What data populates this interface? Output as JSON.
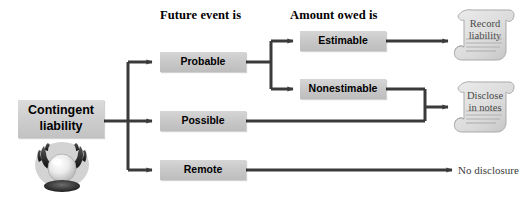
{
  "diagram": {
    "headers": [
      {
        "id": "future-event",
        "label": "Future event is",
        "x": 160,
        "y": 8
      },
      {
        "id": "amount-owed",
        "label": "Amount owed is",
        "x": 290,
        "y": 8
      }
    ],
    "root": {
      "id": "contingent-liability",
      "label": "Contingent\nliability",
      "x": 18,
      "y": 100,
      "w": 86,
      "h": 38
    },
    "likelihood_nodes": [
      {
        "id": "probable",
        "label": "Probable",
        "x": 160,
        "y": 52,
        "w": 86,
        "h": 20
      },
      {
        "id": "possible",
        "label": "Possible",
        "x": 160,
        "y": 111,
        "w": 86,
        "h": 20
      },
      {
        "id": "remote",
        "label": "Remote",
        "x": 160,
        "y": 160,
        "w": 86,
        "h": 20
      }
    ],
    "amount_nodes": [
      {
        "id": "estimable",
        "label": "Estimable",
        "x": 300,
        "y": 31,
        "w": 86,
        "h": 20
      },
      {
        "id": "nonestimable",
        "label": "Nonestimable",
        "x": 300,
        "y": 79,
        "w": 86,
        "h": 20
      }
    ],
    "outcomes": [
      {
        "id": "record-liability",
        "label": "Record\nliability",
        "kind": "scroll",
        "x": 452,
        "y": 6,
        "w": 66,
        "h": 58
      },
      {
        "id": "disclose-in-notes",
        "label": "Disclose\nin notes",
        "kind": "scroll",
        "x": 452,
        "y": 78,
        "w": 66,
        "h": 58
      },
      {
        "id": "no-disclosure",
        "label": "No disclosure",
        "kind": "text",
        "x": 458,
        "y": 164
      }
    ],
    "icons": {
      "crystal_ball": {
        "id": "crystal-ball-icon",
        "x": 33,
        "y": 140,
        "w": 58,
        "h": 54
      }
    },
    "colors": {
      "node_fill": "#c9c9c9",
      "node_text": "#000000",
      "wire": "#3a3a3a",
      "scroll_fill": "#dcdcdc",
      "scroll_text": "#4a4a4a",
      "background": "#ffffff"
    },
    "wires": {
      "trunk_x": 128,
      "trunk_top_y": 62,
      "trunk_bottom_y": 170,
      "branch_x": 271,
      "merge_x": 425,
      "rows": {
        "probable_y": 62,
        "possible_y": 121,
        "remote_y": 170,
        "estimable_y": 41,
        "nonestimable_y": 89,
        "disclose_y": 107
      }
    }
  }
}
